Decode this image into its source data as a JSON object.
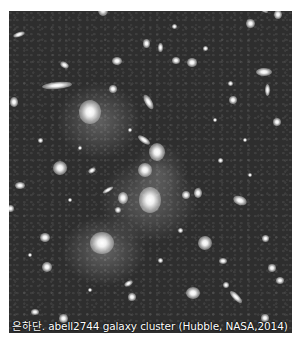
{
  "image": {
    "subject": "abell2744 galaxy cluster deep field",
    "background_color": "#2e2e2e",
    "galaxies": [
      {
        "x": 103,
        "y": 10,
        "w": 10,
        "h": 12,
        "r": 0
      },
      {
        "x": 262,
        "y": 8,
        "w": 14,
        "h": 5,
        "r": 35
      },
      {
        "x": 278,
        "y": 14,
        "w": 8,
        "h": 9,
        "r": 0
      },
      {
        "x": 250,
        "y": 23,
        "w": 9,
        "h": 9,
        "r": 0
      },
      {
        "x": 19,
        "y": 34,
        "w": 12,
        "h": 5,
        "r": -20
      },
      {
        "x": 146,
        "y": 43,
        "w": 7,
        "h": 9,
        "r": 0
      },
      {
        "x": 160,
        "y": 47,
        "w": 5,
        "h": 9,
        "r": 0
      },
      {
        "x": 117,
        "y": 61,
        "w": 10,
        "h": 8,
        "r": 0
      },
      {
        "x": 176,
        "y": 60,
        "w": 8,
        "h": 7,
        "r": 0
      },
      {
        "x": 192,
        "y": 62,
        "w": 10,
        "h": 9,
        "r": 0
      },
      {
        "x": 57,
        "y": 85,
        "w": 30,
        "h": 7,
        "r": -5
      },
      {
        "x": 64,
        "y": 65,
        "w": 9,
        "h": 6,
        "r": 30
      },
      {
        "x": 113,
        "y": 89,
        "w": 8,
        "h": 8,
        "r": 0
      },
      {
        "x": 90,
        "y": 112,
        "w": 22,
        "h": 24,
        "r": 0
      },
      {
        "x": 148,
        "y": 102,
        "w": 7,
        "h": 16,
        "r": -30
      },
      {
        "x": 264,
        "y": 72,
        "w": 16,
        "h": 8,
        "r": 0
      },
      {
        "x": 267,
        "y": 90,
        "w": 5,
        "h": 12,
        "r": 0
      },
      {
        "x": 277,
        "y": 122,
        "w": 8,
        "h": 8,
        "r": 0
      },
      {
        "x": 233,
        "y": 100,
        "w": 8,
        "h": 8,
        "r": 0
      },
      {
        "x": 14,
        "y": 102,
        "w": 8,
        "h": 10,
        "r": 0
      },
      {
        "x": 144,
        "y": 140,
        "w": 14,
        "h": 6,
        "r": 35
      },
      {
        "x": 157,
        "y": 152,
        "w": 16,
        "h": 18,
        "r": 0
      },
      {
        "x": 145,
        "y": 170,
        "w": 14,
        "h": 14,
        "r": 0
      },
      {
        "x": 60,
        "y": 168,
        "w": 14,
        "h": 14,
        "r": 0
      },
      {
        "x": 92,
        "y": 170,
        "w": 8,
        "h": 5,
        "r": -30
      },
      {
        "x": 108,
        "y": 190,
        "w": 12,
        "h": 4,
        "r": -30
      },
      {
        "x": 150,
        "y": 200,
        "w": 22,
        "h": 26,
        "r": 0
      },
      {
        "x": 123,
        "y": 198,
        "w": 10,
        "h": 12,
        "r": 0
      },
      {
        "x": 118,
        "y": 210,
        "w": 6,
        "h": 6,
        "r": 0
      },
      {
        "x": 198,
        "y": 193,
        "w": 8,
        "h": 10,
        "r": 0
      },
      {
        "x": 186,
        "y": 195,
        "w": 8,
        "h": 8,
        "r": 0
      },
      {
        "x": 20,
        "y": 185,
        "w": 10,
        "h": 7,
        "r": 0
      },
      {
        "x": 10,
        "y": 208,
        "w": 7,
        "h": 7,
        "r": 0
      },
      {
        "x": 240,
        "y": 200,
        "w": 14,
        "h": 9,
        "r": 20
      },
      {
        "x": 265,
        "y": 238,
        "w": 7,
        "h": 7,
        "r": 0
      },
      {
        "x": 102,
        "y": 243,
        "w": 24,
        "h": 22,
        "r": 0
      },
      {
        "x": 45,
        "y": 237,
        "w": 10,
        "h": 9,
        "r": 0
      },
      {
        "x": 205,
        "y": 243,
        "w": 14,
        "h": 14,
        "r": 0
      },
      {
        "x": 223,
        "y": 261,
        "w": 8,
        "h": 6,
        "r": 0
      },
      {
        "x": 272,
        "y": 268,
        "w": 8,
        "h": 8,
        "r": 0
      },
      {
        "x": 47,
        "y": 267,
        "w": 10,
        "h": 10,
        "r": 0
      },
      {
        "x": 128,
        "y": 283,
        "w": 9,
        "h": 5,
        "r": -30
      },
      {
        "x": 132,
        "y": 297,
        "w": 8,
        "h": 8,
        "r": 0
      },
      {
        "x": 193,
        "y": 293,
        "w": 14,
        "h": 12,
        "r": 0
      },
      {
        "x": 236,
        "y": 297,
        "w": 16,
        "h": 6,
        "r": 45
      },
      {
        "x": 226,
        "y": 285,
        "w": 6,
        "h": 6,
        "r": 0
      },
      {
        "x": 280,
        "y": 280,
        "w": 8,
        "h": 7,
        "r": 0
      },
      {
        "x": 35,
        "y": 312,
        "w": 8,
        "h": 6,
        "r": 0
      },
      {
        "x": 63,
        "y": 318,
        "w": 9,
        "h": 9,
        "r": 0
      },
      {
        "x": 265,
        "y": 318,
        "w": 8,
        "h": 8,
        "r": 0
      },
      {
        "x": 174,
        "y": 26,
        "w": 5,
        "h": 5,
        "r": 0
      },
      {
        "x": 205,
        "y": 48,
        "w": 5,
        "h": 5,
        "r": 0
      },
      {
        "x": 230,
        "y": 83,
        "w": 5,
        "h": 5,
        "r": 0
      },
      {
        "x": 40,
        "y": 140,
        "w": 5,
        "h": 5,
        "r": 0
      },
      {
        "x": 80,
        "y": 148,
        "w": 4,
        "h": 4,
        "r": 0
      },
      {
        "x": 220,
        "y": 160,
        "w": 5,
        "h": 5,
        "r": 0
      },
      {
        "x": 250,
        "y": 175,
        "w": 4,
        "h": 4,
        "r": 0
      },
      {
        "x": 180,
        "y": 230,
        "w": 5,
        "h": 5,
        "r": 0
      },
      {
        "x": 30,
        "y": 255,
        "w": 4,
        "h": 4,
        "r": 0
      },
      {
        "x": 160,
        "y": 260,
        "w": 5,
        "h": 5,
        "r": 0
      },
      {
        "x": 90,
        "y": 290,
        "w": 4,
        "h": 4,
        "r": 0
      },
      {
        "x": 245,
        "y": 140,
        "w": 4,
        "h": 4,
        "r": 0
      },
      {
        "x": 130,
        "y": 130,
        "w": 4,
        "h": 4,
        "r": 0
      },
      {
        "x": 70,
        "y": 200,
        "w": 4,
        "h": 4,
        "r": 0
      },
      {
        "x": 215,
        "y": 120,
        "w": 4,
        "h": 4,
        "r": 0
      }
    ]
  },
  "caption": {
    "text": "은하단. abell2744 galaxy cluster (Hubble, NASA,2014)"
  }
}
